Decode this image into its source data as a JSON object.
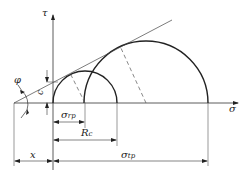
{
  "diagram": {
    "type": "mohr-coulomb-envelope",
    "axes": {
      "horizontal_label": "σ",
      "vertical_label": "τ"
    },
    "labels": {
      "phi": "φ",
      "c": "c",
      "sigma_rp": {
        "main": "σ",
        "sub": "rp"
      },
      "R_c": {
        "main": "R",
        "sub": "c"
      },
      "sigma_tp": {
        "main": "σ",
        "sub": "tp"
      },
      "x": "x"
    },
    "circles": [
      {
        "name": "small-mohr-circle",
        "cx": 85,
        "cy": 103,
        "r": 32
      },
      {
        "name": "large-mohr-circle",
        "cx": 146,
        "cy": 103,
        "r": 62
      }
    ],
    "colors": {
      "stroke": "#222222",
      "thin": "#444444",
      "dashed": "#555555"
    }
  }
}
